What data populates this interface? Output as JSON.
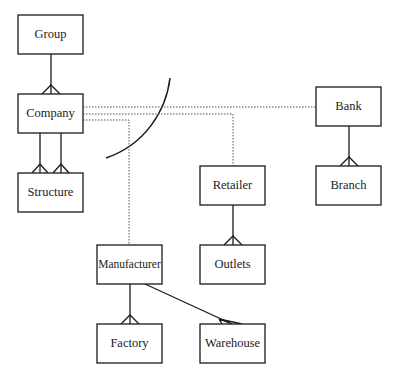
{
  "diagram": {
    "type": "entity-relationship",
    "colors": {
      "stroke": "#1a1a1a",
      "dotted": "#555555",
      "background": "#ffffff",
      "text": "#222222"
    },
    "entities": [
      {
        "id": "group",
        "label": "Group",
        "x": 18,
        "y": 15,
        "w": 65,
        "h": 39
      },
      {
        "id": "company",
        "label": "Company",
        "x": 18,
        "y": 94,
        "w": 65,
        "h": 39
      },
      {
        "id": "structure",
        "label": "Structure",
        "x": 18,
        "y": 173,
        "w": 65,
        "h": 39
      },
      {
        "id": "bank",
        "label": "Bank",
        "x": 316,
        "y": 87,
        "w": 65,
        "h": 39
      },
      {
        "id": "branch",
        "label": "Branch",
        "x": 316,
        "y": 166,
        "w": 65,
        "h": 39
      },
      {
        "id": "retailer",
        "label": "Retailer",
        "x": 200,
        "y": 166,
        "w": 65,
        "h": 39
      },
      {
        "id": "outlets",
        "label": "Outlets",
        "x": 200,
        "y": 245,
        "w": 65,
        "h": 39
      },
      {
        "id": "manufacturer",
        "label": "Manufacturer",
        "x": 97,
        "y": 245,
        "w": 65,
        "h": 39
      },
      {
        "id": "factory",
        "label": "Factory",
        "x": 97,
        "y": 324,
        "w": 65,
        "h": 39
      },
      {
        "id": "warehouse",
        "label": "Warehouse",
        "x": 200,
        "y": 324,
        "w": 65,
        "h": 39
      }
    ],
    "relationships": [
      {
        "from": "group",
        "to": "company",
        "style": "solid",
        "cardinality": "one-to-many"
      },
      {
        "from": "company",
        "to": "structure",
        "style": "solid",
        "cardinality": "one-to-many",
        "count": 2
      },
      {
        "from": "bank",
        "to": "branch",
        "style": "solid",
        "cardinality": "one-to-many"
      },
      {
        "from": "retailer",
        "to": "outlets",
        "style": "solid",
        "cardinality": "one-to-many"
      },
      {
        "from": "manufacturer",
        "to": "factory",
        "style": "solid",
        "cardinality": "one-to-many"
      },
      {
        "from": "manufacturer",
        "to": "warehouse",
        "style": "solid",
        "cardinality": "one-to-many"
      },
      {
        "from": "company",
        "to": "bank",
        "style": "dotted"
      },
      {
        "from": "company",
        "to": "retailer",
        "style": "dotted"
      },
      {
        "from": "company",
        "to": "manufacturer",
        "style": "dotted"
      }
    ],
    "annotations": [
      {
        "type": "boundary-arc",
        "from": [
          170,
          78
        ],
        "to": [
          106,
          158
        ]
      }
    ]
  }
}
